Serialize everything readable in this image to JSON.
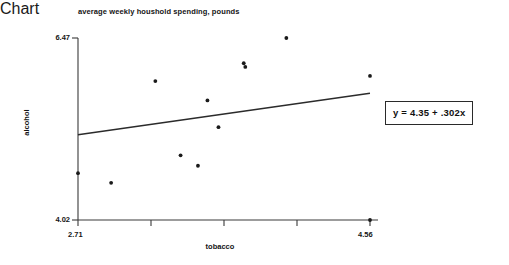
{
  "chart_data": {
    "type": "scatter",
    "title": "average weekly houshold spending, pounds",
    "xlabel": "tobacco",
    "ylabel": "alcohol",
    "xlim": [
      2.71,
      4.56
    ],
    "ylim": [
      4.02,
      6.47
    ],
    "xticks": [
      "2.71",
      "4.56"
    ],
    "yticks": [
      "4.02",
      "6.47"
    ],
    "grid": false,
    "legend": null,
    "points": [
      {
        "x": 2.71,
        "y": 4.65
      },
      {
        "x": 2.92,
        "y": 4.52
      },
      {
        "x": 3.2,
        "y": 5.89
      },
      {
        "x": 3.36,
        "y": 4.89
      },
      {
        "x": 3.47,
        "y": 4.75
      },
      {
        "x": 3.53,
        "y": 5.63
      },
      {
        "x": 3.6,
        "y": 5.27
      },
      {
        "x": 3.76,
        "y": 6.13
      },
      {
        "x": 3.77,
        "y": 6.08
      },
      {
        "x": 4.03,
        "y": 6.47
      },
      {
        "x": 4.56,
        "y": 5.96
      },
      {
        "x": 4.56,
        "y": 4.02
      }
    ],
    "fit_line": {
      "equation": "y = 4.35 + .302x",
      "intercept": 4.35,
      "slope": 0.302,
      "x_start": 2.71,
      "x_end": 4.56
    },
    "annotations": [
      {
        "name": "equation-box",
        "text": "y = 4.35 + .302x"
      }
    ]
  },
  "chart": {
    "title": "average weekly houshold spending, pounds",
    "x_axis_title": "tobacco",
    "y_axis_title": "alcohol",
    "y_tick_top": "6.47",
    "y_tick_bottom": "4.02",
    "x_tick_left": "2.71",
    "x_tick_right": "4.56",
    "equation_label": "y = 4.35 + .302x",
    "colors": {
      "axis": "#3a3a3a",
      "point": "#1a1a1a",
      "fit_line": "#2b2b2b",
      "background": "#ffffff",
      "box_border": "#2a2a2a"
    }
  }
}
